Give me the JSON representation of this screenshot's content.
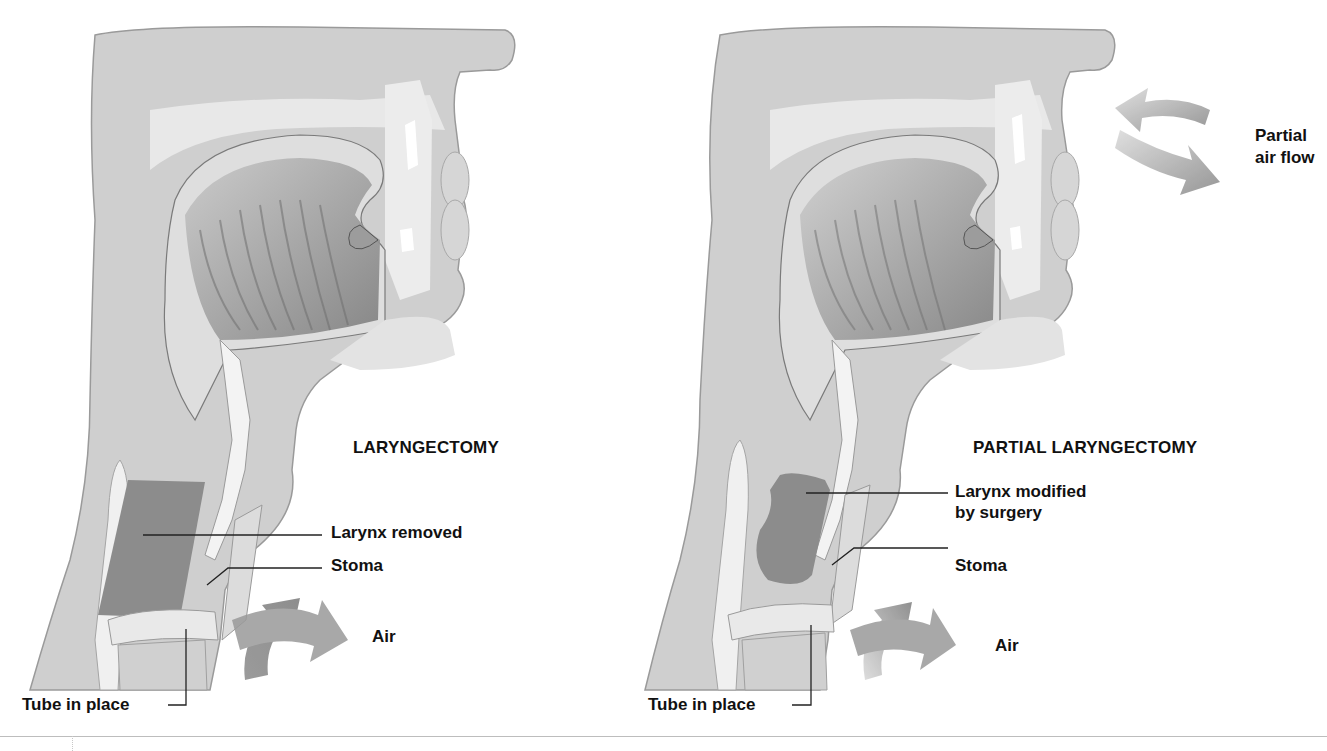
{
  "figure": {
    "panels": [
      {
        "id": "laryngectomy",
        "title": "LARYNGECTOMY",
        "labels": {
          "larynx": "Larynx removed",
          "stoma": "Stoma",
          "air": "Air",
          "tube": "Tube in place"
        }
      },
      {
        "id": "partial-laryngectomy",
        "title": "PARTIAL LARYNGECTOMY",
        "labels": {
          "larynx_line1": "Larynx modified",
          "larynx_line2": "by surgery",
          "stoma": "Stoma",
          "air": "Air",
          "tube": "Tube in place",
          "partial_line1": "Partial",
          "partial_line2": "air flow"
        }
      }
    ],
    "colors": {
      "tissue_light": "#d9d9d9",
      "tissue_mid": "#b8b8b8",
      "tissue_dark": "#8f8f8f",
      "larynx_region": "#8a8a8a",
      "arrow": "#8c8c8c",
      "label_text": "#111111",
      "leader_line": "#222222"
    }
  }
}
